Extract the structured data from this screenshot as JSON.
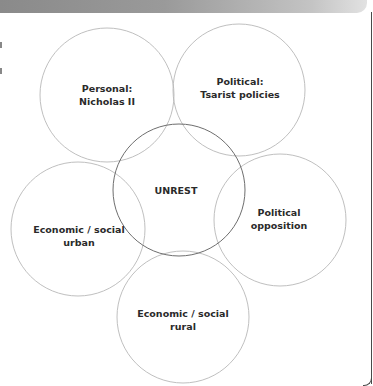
{
  "diagram": {
    "colors": {
      "header_gradient_start": "#8a8a8a",
      "header_gradient_end": "#e2e2e2",
      "outer_circle_stroke": "#b8b8b8",
      "center_circle_stroke": "#6e6e6e",
      "label_text": "#2a2a2a"
    },
    "center": {
      "label": "UNREST",
      "cx": 179,
      "cy": 190,
      "r": 66
    },
    "circles": [
      {
        "id": "personal",
        "line1": "Personal:",
        "line2": "Nicholas II",
        "cx": 107,
        "cy": 95,
        "r": 67
      },
      {
        "id": "political-tsarist",
        "line1": "Political:",
        "line2": "Tsarist policies",
        "cx": 239,
        "cy": 90,
        "r": 66
      },
      {
        "id": "political-opposition",
        "line1": "Political",
        "line2": "opposition",
        "cx": 280,
        "cy": 220,
        "r": 66
      },
      {
        "id": "economic-rural",
        "line1": "Economic / social",
        "line2": "rural",
        "cx": 183,
        "cy": 317,
        "r": 66
      },
      {
        "id": "economic-urban",
        "line1": "Economic / social",
        "line2": "urban",
        "cx": 78,
        "cy": 229,
        "r": 67
      }
    ]
  }
}
